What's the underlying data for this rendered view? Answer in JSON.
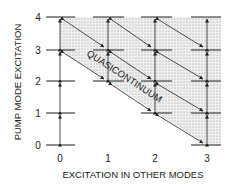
{
  "diagram": {
    "ylabel": "PUMP MODE EXCITATION",
    "xlabel": "EXCITATION IN OTHER MODES",
    "x_ticks": [
      "0",
      "1",
      "2",
      "3"
    ],
    "y_ticks": [
      "0",
      "1",
      "2",
      "3",
      "4"
    ],
    "region_label": "QUASICONTINUUM",
    "colors": {
      "line": "#222222",
      "shade": "#d8d8d8",
      "background": "#ffffff"
    }
  }
}
